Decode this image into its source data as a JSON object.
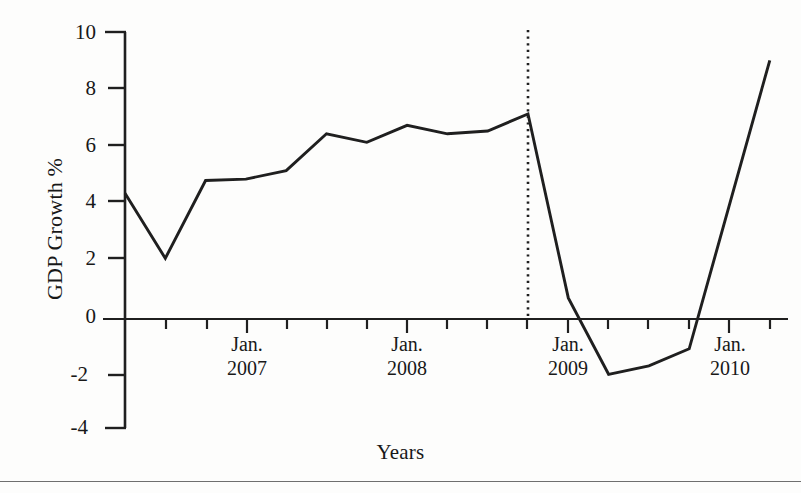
{
  "chart_data": {
    "type": "line",
    "title": "",
    "xlabel": "Years",
    "ylabel": "GDP Growth %",
    "ylim": [
      -4,
      10
    ],
    "yticks": [
      10,
      8,
      6,
      4,
      2,
      0,
      -2,
      -4
    ],
    "ytick_labels": [
      "10",
      "8",
      "6",
      "4",
      "2",
      "0",
      "-2",
      "-4"
    ],
    "grid": false,
    "legend": "none",
    "x_major_labels": [
      {
        "month": "Jan.",
        "year": "2007",
        "tick_index": 1
      },
      {
        "month": "Jan.",
        "year": "2008",
        "tick_index": 5
      },
      {
        "month": "Jan.",
        "year": "2009",
        "tick_index": 9
      },
      {
        "month": "Jan.",
        "year": "2010",
        "tick_index": 13
      }
    ],
    "x_tick_count": 17,
    "series": [
      {
        "name": "GDP Growth %",
        "values": [
          4.3,
          2.0,
          4.75,
          4.8,
          5.1,
          6.4,
          6.1,
          6.7,
          6.4,
          6.5,
          7.1,
          0.6,
          -2.1,
          -1.8,
          -1.2,
          9.0
        ]
      }
    ],
    "annotations": [
      {
        "type": "vertical-dotted-line",
        "x_index": 10,
        "label": ""
      }
    ],
    "line_color": "#1f1f1f",
    "axis_color": "#1f1f1f"
  },
  "figure": {
    "background": "#fdfdfc",
    "bottom_rule_color": "#6f6f6f"
  }
}
